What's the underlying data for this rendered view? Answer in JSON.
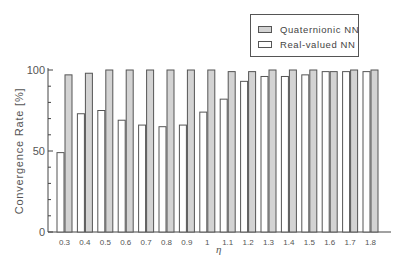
{
  "chart_data": {
    "type": "bar",
    "title": "",
    "xlabel": "η",
    "ylabel": "Convergence Rate [%]",
    "ylim": [
      0,
      100
    ],
    "yticks": [
      0,
      50,
      100
    ],
    "yminor_step": 10,
    "grid": false,
    "legend_position": "top-right",
    "categories": [
      "0.3",
      "0.4",
      "0.5",
      "0.6",
      "0.7",
      "0.8",
      "0.9",
      "1",
      "1.1",
      "1.2",
      "1.3",
      "1.4",
      "1.5",
      "1.6",
      "1.7",
      "1.8"
    ],
    "series": [
      {
        "name": "Real-valued NN",
        "color": "#ffffff",
        "values": [
          49,
          73,
          75,
          69,
          66,
          65,
          66,
          74,
          82,
          93,
          96,
          96,
          97,
          99,
          99,
          99
        ]
      },
      {
        "name": "Quaternionic NN",
        "color": "#d3d3d3",
        "values": [
          97,
          98,
          100,
          100,
          100,
          100,
          100,
          100,
          99,
          99,
          100,
          100,
          100,
          99,
          100,
          100
        ]
      }
    ]
  },
  "legend": {
    "items": [
      {
        "label": "Quaternionic NN",
        "color": "#d3d3d3"
      },
      {
        "label": "Real-valued NN",
        "color": "#ffffff"
      }
    ]
  },
  "axes": {
    "xlabel": "η",
    "ylabel": "Convergence Rate [%]"
  }
}
